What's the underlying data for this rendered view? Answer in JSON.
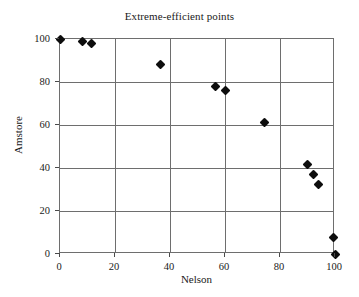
{
  "chart_data": {
    "type": "scatter",
    "title": "Extreme-efficient points",
    "xlabel": "Nelson",
    "ylabel": "Amstore",
    "xlim": [
      0,
      100
    ],
    "ylim": [
      0,
      100
    ],
    "xticks": [
      0,
      20,
      40,
      60,
      80,
      100
    ],
    "yticks": [
      0,
      20,
      40,
      60,
      80,
      100
    ],
    "xtick_labels": [
      "0",
      "20",
      "40",
      "60",
      "80",
      "100"
    ],
    "ytick_labels": [
      "0",
      "20",
      "40",
      "60",
      "80",
      "100"
    ],
    "grid": true,
    "grid_color": "#6e6e6e",
    "legend": false,
    "marker": "diamond",
    "marker_color": "#0d0d0d",
    "series": [
      {
        "name": "Extreme-efficient points",
        "points": [
          {
            "x": 0,
            "y": 100
          },
          {
            "x": 8,
            "y": 99
          },
          {
            "x": 11.5,
            "y": 98
          },
          {
            "x": 36.5,
            "y": 88
          },
          {
            "x": 56.5,
            "y": 78
          },
          {
            "x": 60,
            "y": 76
          },
          {
            "x": 74.5,
            "y": 61
          },
          {
            "x": 90,
            "y": 41.5
          },
          {
            "x": 92,
            "y": 37
          },
          {
            "x": 94,
            "y": 32.5
          },
          {
            "x": 99.5,
            "y": 7.5
          },
          {
            "x": 100,
            "y": 0
          }
        ]
      }
    ]
  }
}
